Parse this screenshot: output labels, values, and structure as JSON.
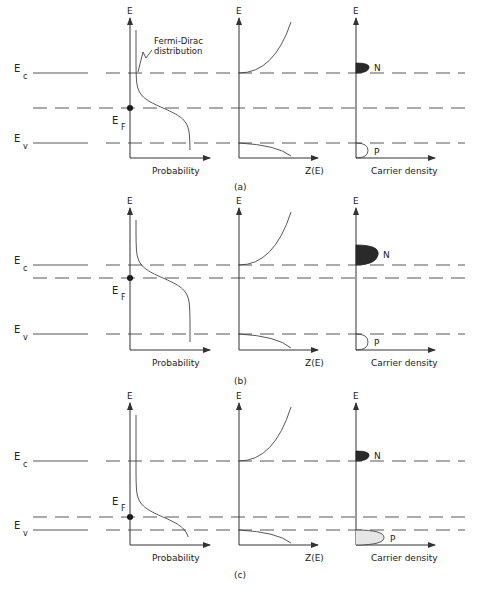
{
  "figure": {
    "panels": [
      {
        "id": "a",
        "caption": "(a)",
        "band_labels": {
          "ec": "E",
          "ec_sub": "c",
          "ev": "E",
          "ev_sub": "v",
          "ef": "E",
          "ef_sub": "F"
        },
        "fermi_position": "midgap",
        "annotation": [
          "Fermi-Dirac",
          "distribution"
        ],
        "carrier_density": {
          "N": "small",
          "P": "small",
          "p_fill": "none"
        }
      },
      {
        "id": "b",
        "caption": "(b)",
        "band_labels": {
          "ec": "E",
          "ec_sub": "c",
          "ev": "E",
          "ev_sub": "v",
          "ef": "E",
          "ef_sub": "F"
        },
        "fermi_position": "near-conduction-band",
        "annotation": [],
        "carrier_density": {
          "N": "large",
          "P": "small",
          "p_fill": "none"
        }
      },
      {
        "id": "c",
        "caption": "(c)",
        "band_labels": {
          "ec": "E",
          "ec_sub": "c",
          "ev": "E",
          "ev_sub": "v",
          "ef": "E",
          "ef_sub": "F"
        },
        "fermi_position": "near-valence-band",
        "annotation": [],
        "carrier_density": {
          "N": "small",
          "P": "large",
          "p_fill": "light"
        }
      }
    ],
    "axis_labels": {
      "y": "E",
      "probability": "Probability",
      "density_of_states": "Z(E)",
      "carrier_density": "Carrier density"
    },
    "carrier_labels": {
      "n": "N",
      "p": "P"
    },
    "colors": {
      "ink": "#333333",
      "n_fill": "#2a2a2a",
      "p_fill_light": "#e6e6e6"
    }
  }
}
